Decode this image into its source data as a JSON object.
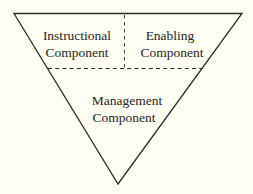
{
  "diagram": {
    "type": "inverted-triangle",
    "colors": {
      "background": "#fefef3",
      "stroke": "#2a2a2a",
      "text": "#262626"
    },
    "sections": [
      {
        "id": "instructional",
        "line1": "Instructional",
        "line2": "Component"
      },
      {
        "id": "enabling",
        "line1": "Enabling",
        "line2": "Component"
      },
      {
        "id": "management",
        "line1": "Management",
        "line2": "Component"
      }
    ],
    "dividers": [
      {
        "orientation": "horizontal",
        "style": "dashed"
      },
      {
        "orientation": "vertical",
        "style": "dashed"
      }
    ]
  }
}
